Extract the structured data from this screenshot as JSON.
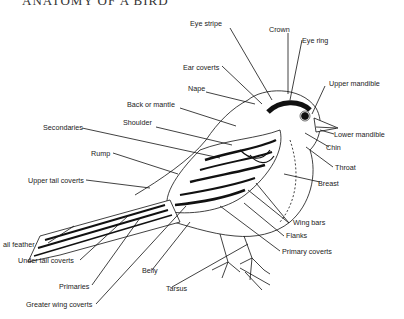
{
  "title": "ANATOMY OF A BIRD",
  "labels": {
    "eye_stripe": "Eye stripe",
    "crown": "Crown",
    "eye_ring": "Eye ring",
    "ear_coverts": "Ear coverts",
    "upper_mandible": "Upper mandible",
    "nape": "Nape",
    "back_or_mantle": "Back or mantle",
    "lower_mandible": "Lower mandible",
    "shoulder": "Shoulder",
    "secondaries": "Secondaries",
    "chin": "Chin",
    "throat": "Throat",
    "rump": "Rump",
    "breast": "Breast",
    "upper_tail_coverts": "Upper tail coverts",
    "wing_bars": "Wing bars",
    "flanks": "Flanks",
    "tail_feather": "ail feather",
    "primary_coverts": "Primary coverts",
    "under_tail_coverts": "Under tail coverts",
    "belly": "Belly",
    "primaries": "Primaries",
    "tarsus": "Tarsus",
    "greater_wing_coverts": "Greater wing coverts"
  }
}
